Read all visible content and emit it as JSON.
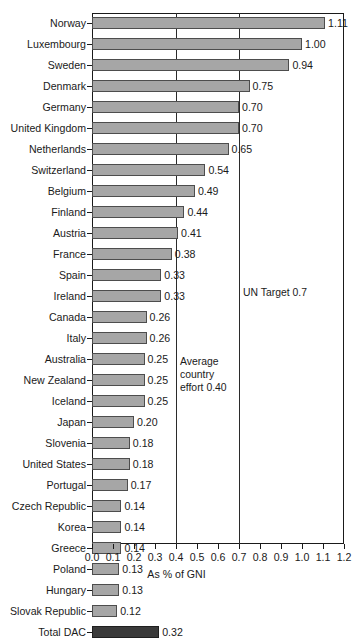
{
  "chart_data": {
    "type": "bar",
    "orientation": "horizontal",
    "title": "",
    "xlabel": "As % of GNI",
    "ylabel": "",
    "xlim": [
      0.0,
      1.2
    ],
    "grid": true,
    "xticks": [
      "0.0",
      "0.1",
      "0.2",
      "0.3",
      "0.4",
      "0.5",
      "0.6",
      "0.7",
      "0.8",
      "0.9",
      "1.0",
      "1.1",
      "1.2"
    ],
    "xtick_values": [
      0.0,
      0.1,
      0.2,
      0.3,
      0.4,
      0.5,
      0.6,
      0.7,
      0.8,
      0.9,
      1.0,
      1.1,
      1.2
    ],
    "gridline_values": [
      0.4,
      0.7
    ],
    "categories": [
      "Norway",
      "Luxembourg",
      "Sweden",
      "Denmark",
      "Germany",
      "United Kingdom",
      "Netherlands",
      "Switzerland",
      "Belgium",
      "Finland",
      "Austria",
      "France",
      "Spain",
      "Ireland",
      "Canada",
      "Italy",
      "Australia",
      "New Zealand",
      "Iceland",
      "Japan",
      "Slovenia",
      "United States",
      "Portugal",
      "Czech Republic",
      "Korea",
      "Greece",
      "Poland",
      "Hungary",
      "Slovak Republic",
      "Total DAC"
    ],
    "values": [
      1.11,
      1.0,
      0.94,
      0.75,
      0.7,
      0.7,
      0.65,
      0.54,
      0.49,
      0.44,
      0.41,
      0.38,
      0.33,
      0.33,
      0.26,
      0.26,
      0.25,
      0.25,
      0.25,
      0.2,
      0.18,
      0.18,
      0.17,
      0.14,
      0.14,
      0.14,
      0.13,
      0.13,
      0.12,
      0.32
    ],
    "value_labels": [
      "1.11",
      "1.00",
      "0.94",
      "0.75",
      "0.70",
      "0.70",
      "0.65",
      "0.54",
      "0.49",
      "0.44",
      "0.41",
      "0.38",
      "0.33",
      "0.33",
      "0.26",
      "0.26",
      "0.25",
      "0.25",
      "0.25",
      "0.20",
      "0.18",
      "0.18",
      "0.17",
      "0.14",
      "0.14",
      "0.14",
      "0.13",
      "0.13",
      "0.12",
      "0.32"
    ],
    "highlight_category": "Total DAC",
    "annotations": [
      {
        "text": "Average country effort 0.40",
        "value": 0.4
      },
      {
        "text": "UN Target 0.7",
        "value": 0.7
      }
    ],
    "colors": {
      "bar_fill": "#a6a6a6",
      "bar_stroke": "#4d4d4d",
      "total_fill": "#3a3a3a",
      "axis": "#1a1a1a",
      "background": "#ffffff"
    }
  },
  "axis": {
    "xlabel": "As % of GNI"
  },
  "annotations": {
    "average_effort": "Average\ncountry\neffort 0.40",
    "un_target": "UN Target 0.7"
  }
}
